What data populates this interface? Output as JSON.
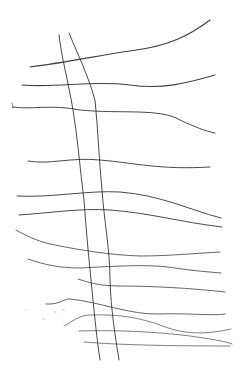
{
  "drawing": {
    "width": 247,
    "height": 373,
    "background": "#ffffff",
    "ink_color": "#2a2a2a",
    "faint_ink_color": "#9a9a9a",
    "horizontal_lines": [
      {
        "d": "M30,67 C70,62 100,55 130,51 C170,46 190,35 210,20",
        "w": 1.1,
        "o": 0.9
      },
      {
        "d": "M22,85 C60,88 90,80 130,85 C165,90 190,82 215,75",
        "w": 1.1,
        "o": 0.9
      },
      {
        "d": "M13,107 C30,110 50,104 80,110 C120,114 160,108 180,120 C195,127 205,131 215,133",
        "w": 1.0,
        "o": 0.85
      },
      {
        "d": "M28,161 C50,165 70,157 100,160 C135,163 160,170 210,167",
        "w": 1.0,
        "o": 0.85
      },
      {
        "d": "M17,196 C50,198 90,190 120,192 C160,195 190,210 221,218",
        "w": 1.0,
        "o": 0.85
      },
      {
        "d": "M19,215 C50,213 80,208 110,210 C150,213 180,222 222,227",
        "w": 1.0,
        "o": 0.85
      },
      {
        "d": "M16,230 C30,238 40,242 55,245 C80,250 110,255 140,256 C170,256 200,253 220,252",
        "w": 0.9,
        "o": 0.8
      },
      {
        "d": "M28,259 C45,265 60,268 80,268 C120,266 150,264 175,268 C195,271 210,272 221,273",
        "w": 0.9,
        "o": 0.8
      },
      {
        "d": "M78,279 C90,283 100,286 120,286 C150,286 190,288 225,292",
        "w": 0.9,
        "o": 0.8
      },
      {
        "d": "M46,304 C60,305 65,298 70,299 C100,302 130,315 160,314 C190,313 210,316 225,314",
        "w": 0.9,
        "o": 0.8
      },
      {
        "d": "M64,326 C75,320 80,315 90,315 C120,314 140,318 160,325 C180,333 200,336 231,329",
        "w": 0.8,
        "o": 0.75
      },
      {
        "d": "M79,331 C110,330 150,331 190,336 C210,339 225,341 232,344",
        "w": 0.8,
        "o": 0.75
      },
      {
        "d": "M84,342 C120,345 170,346 230,346",
        "w": 0.8,
        "o": 0.75
      }
    ],
    "vertical_lines": [
      {
        "d": "M59,35 C62,60 68,80 73,110 C78,140 80,170 84,200 C86,230 89,260 92,290 C95,320 97,340 100,360",
        "w": 1.0,
        "o": 0.85
      },
      {
        "d": "M69,33 C78,55 88,75 95,100 C98,130 99,160 102,190 C104,220 110,250 110,280 C111,310 115,335 119,360",
        "w": 1.0,
        "o": 0.85
      }
    ],
    "marks": [
      {
        "d": "M12,103 L13,108",
        "w": 0.8,
        "o": 0.7
      },
      {
        "d": "M43,319 L44,319",
        "w": 1.2,
        "o": 0.35
      },
      {
        "d": "M55,312 L56,312",
        "w": 1.2,
        "o": 0.35
      },
      {
        "d": "M63,310 L64,310",
        "w": 1.2,
        "o": 0.35
      },
      {
        "d": "M25,310 L26,310",
        "w": 1.0,
        "o": 0.25
      }
    ]
  }
}
